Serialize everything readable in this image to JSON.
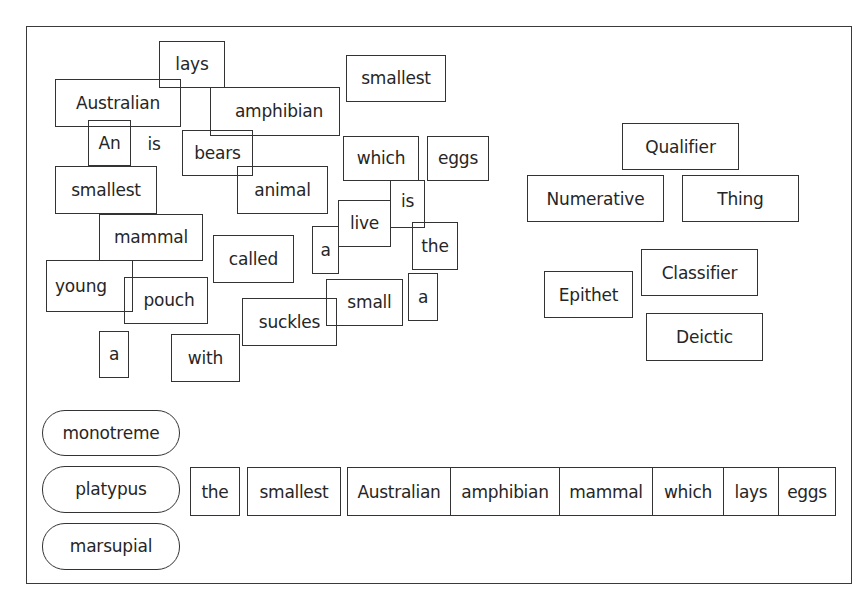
{
  "scattered_words": [
    {
      "id": "lays",
      "text": "lays",
      "x": 159,
      "y": 41,
      "w": 66,
      "h": 47,
      "boxed": true
    },
    {
      "id": "australian",
      "text": "Australian",
      "x": 55,
      "y": 79,
      "w": 126,
      "h": 48,
      "boxed": true
    },
    {
      "id": "amphibian",
      "text": "amphibian",
      "x": 210,
      "y": 87,
      "w": 130,
      "h": 49,
      "boxed": true
    },
    {
      "id": "smallest-top",
      "text": "smallest",
      "x": 346,
      "y": 55,
      "w": 100,
      "h": 47,
      "boxed": true
    },
    {
      "id": "an",
      "text": "An",
      "x": 88,
      "y": 120,
      "w": 43,
      "h": 46,
      "boxed": true
    },
    {
      "id": "is-free",
      "text": "is",
      "x": 140,
      "y": 124,
      "w": 28,
      "h": 40,
      "boxed": false
    },
    {
      "id": "bears",
      "text": "bears",
      "x": 182,
      "y": 130,
      "w": 71,
      "h": 46,
      "boxed": true
    },
    {
      "id": "which",
      "text": "which",
      "x": 343,
      "y": 136,
      "w": 76,
      "h": 45,
      "boxed": true
    },
    {
      "id": "eggs",
      "text": "eggs",
      "x": 427,
      "y": 136,
      "w": 62,
      "h": 45,
      "boxed": true
    },
    {
      "id": "smallest-left",
      "text": "smallest",
      "x": 55,
      "y": 166,
      "w": 102,
      "h": 48,
      "boxed": true
    },
    {
      "id": "animal",
      "text": "animal",
      "x": 237,
      "y": 166,
      "w": 91,
      "h": 48,
      "boxed": true
    },
    {
      "id": "is-boxed",
      "text": "is",
      "x": 390,
      "y": 180,
      "w": 35,
      "h": 48,
      "boxed": true
    },
    {
      "id": "live",
      "text": "live",
      "x": 338,
      "y": 200,
      "w": 53,
      "h": 47,
      "boxed": true
    },
    {
      "id": "mammal",
      "text": "mammal",
      "x": 99,
      "y": 214,
      "w": 104,
      "h": 47,
      "boxed": true
    },
    {
      "id": "the",
      "text": "the",
      "x": 412,
      "y": 222,
      "w": 46,
      "h": 48,
      "boxed": true
    },
    {
      "id": "a-middle",
      "text": "a",
      "x": 312,
      "y": 226,
      "w": 27,
      "h": 48,
      "boxed": true
    },
    {
      "id": "called",
      "text": "called",
      "x": 213,
      "y": 235,
      "w": 81,
      "h": 48,
      "boxed": true
    },
    {
      "id": "young",
      "text": "young",
      "x": 46,
      "y": 260,
      "w": 87,
      "h": 52,
      "boxed": true
    },
    {
      "id": "a-right",
      "text": "a",
      "x": 408,
      "y": 273,
      "w": 30,
      "h": 48,
      "boxed": true
    },
    {
      "id": "pouch",
      "text": "pouch",
      "x": 124,
      "y": 277,
      "w": 84,
      "h": 47,
      "boxed": true
    },
    {
      "id": "small",
      "text": "small",
      "x": 326,
      "y": 279,
      "w": 77,
      "h": 47,
      "boxed": true
    },
    {
      "id": "suckles",
      "text": "suckles",
      "x": 242,
      "y": 298,
      "w": 95,
      "h": 48,
      "boxed": true
    },
    {
      "id": "a-bottom",
      "text": "a",
      "x": 99,
      "y": 331,
      "w": 30,
      "h": 47,
      "boxed": true
    },
    {
      "id": "with",
      "text": "with",
      "x": 171,
      "y": 334,
      "w": 69,
      "h": 48,
      "boxed": true
    }
  ],
  "function_labels": [
    {
      "id": "qualifier",
      "text": "Qualifier",
      "x": 622,
      "y": 123,
      "w": 117,
      "h": 47
    },
    {
      "id": "numerative",
      "text": "Numerative",
      "x": 527,
      "y": 175,
      "w": 137,
      "h": 47
    },
    {
      "id": "thing",
      "text": "Thing",
      "x": 682,
      "y": 175,
      "w": 117,
      "h": 47
    },
    {
      "id": "classifier",
      "text": "Classifier",
      "x": 641,
      "y": 249,
      "w": 117,
      "h": 47
    },
    {
      "id": "epithet",
      "text": "Epithet",
      "x": 544,
      "y": 271,
      "w": 89,
      "h": 47
    },
    {
      "id": "deictic",
      "text": "Deictic",
      "x": 646,
      "y": 313,
      "w": 117,
      "h": 48
    }
  ],
  "head_nouns": [
    {
      "id": "monotreme",
      "text": "monotreme",
      "x": 42,
      "y": 410,
      "w": 138,
      "h": 46
    },
    {
      "id": "platypus",
      "text": "platypus",
      "x": 42,
      "y": 466,
      "w": 138,
      "h": 47
    },
    {
      "id": "marsupial",
      "text": "marsupial",
      "x": 42,
      "y": 523,
      "w": 138,
      "h": 47
    }
  ],
  "sequence_row": {
    "y": 467,
    "h": 49,
    "words": [
      {
        "text": "the",
        "x": 190,
        "w": 50,
        "joined": false
      },
      {
        "text": "smallest",
        "x": 247,
        "w": 94,
        "joined": false
      },
      {
        "text": "Australian",
        "x": 347,
        "w": 104,
        "joined": false
      },
      {
        "text": "amphibian",
        "x": 450,
        "w": 110,
        "joined": true
      },
      {
        "text": "mammal",
        "x": 559,
        "w": 94,
        "joined": true
      },
      {
        "text": "which",
        "x": 652,
        "w": 72,
        "joined": true
      },
      {
        "text": "lays",
        "x": 723,
        "w": 56,
        "joined": true
      },
      {
        "text": "eggs",
        "x": 778,
        "w": 58,
        "joined": true
      }
    ]
  }
}
